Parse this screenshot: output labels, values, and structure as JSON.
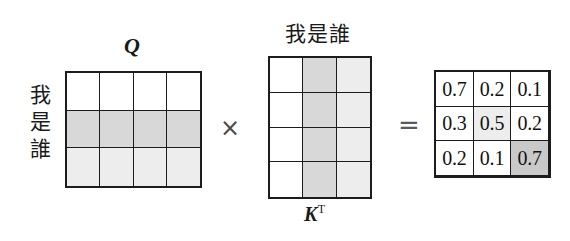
{
  "figure": {
    "operators": {
      "multiply": "×",
      "equals": "="
    },
    "colors": {
      "ink": "#1c1c1c",
      "white": "#ffffff",
      "light_gray": "#ededed",
      "mid_gray": "#d8d8d8",
      "dark_gray": "#c9c9c9"
    }
  },
  "q_matrix": {
    "label": "Q",
    "row_label_chars": [
      "我",
      "是",
      "誰"
    ],
    "rows": 3,
    "cols": 4,
    "row_shades": [
      "white",
      "mid",
      "light"
    ],
    "cells": [
      [
        "",
        "",
        "",
        ""
      ],
      [
        "",
        "",
        "",
        ""
      ],
      [
        "",
        "",
        "",
        ""
      ]
    ]
  },
  "kt_matrix": {
    "label_base": "K",
    "label_sup": "T",
    "col_label": "我是誰",
    "rows": 4,
    "cols": 3,
    "col_shades": [
      "white",
      "mid",
      "light"
    ],
    "cells": [
      [
        "",
        "",
        ""
      ],
      [
        "",
        "",
        ""
      ],
      [
        "",
        "",
        ""
      ],
      [
        "",
        "",
        ""
      ]
    ]
  },
  "result_matrix": {
    "rows": 3,
    "cols": 3,
    "values": [
      [
        "0.7",
        "0.2",
        "0.1"
      ],
      [
        "0.3",
        "0.5",
        "0.2"
      ],
      [
        "0.2",
        "0.1",
        "0.7"
      ]
    ],
    "shades": [
      [
        "white",
        "white",
        "white"
      ],
      [
        "white",
        "light",
        "white"
      ],
      [
        "white",
        "white",
        "dark"
      ]
    ]
  }
}
